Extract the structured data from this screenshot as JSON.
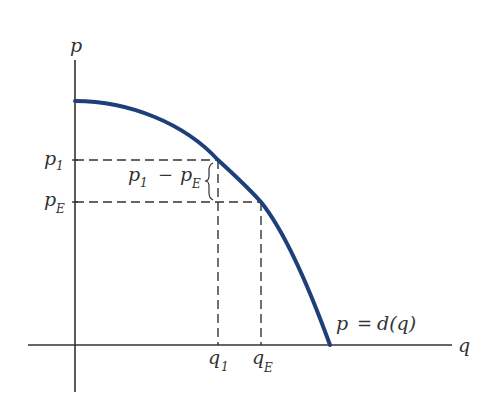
{
  "diagram": {
    "type": "demand-curve",
    "colors": {
      "curve": "#1f3f7a",
      "axes": "#333333",
      "dashes": "#333333"
    },
    "axes": {
      "y_label": "p",
      "x_label": "q"
    },
    "curve": {
      "label_main": "p",
      "label_eq": "=",
      "label_fn": "d(q)"
    },
    "price_labels": {
      "p1_base": "p",
      "p1_sub": "1",
      "pE_base": "p",
      "pE_sub": "E"
    },
    "quantity_labels": {
      "q1_base": "q",
      "q1_sub": "1",
      "qE_base": "q",
      "qE_sub": "E"
    },
    "difference_label": {
      "a_base": "p",
      "a_sub": "1",
      "minus": "−",
      "b_base": "p",
      "b_sub": "E"
    }
  }
}
